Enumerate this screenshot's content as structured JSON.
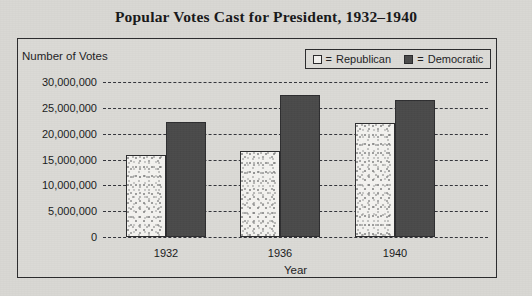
{
  "chart_data": {
    "type": "bar",
    "title": "Popular Votes Cast for President, 1932–1940",
    "xlabel": "Year",
    "ylabel": "Number of Votes",
    "categories": [
      "1932",
      "1936",
      "1940"
    ],
    "series": [
      {
        "name": "Republican",
        "values": [
          15800000,
          16700000,
          22000000
        ],
        "color": "#f4f3f0",
        "pattern": "stipple"
      },
      {
        "name": "Democratic",
        "values": [
          22300000,
          27500000,
          26500000
        ],
        "color": "#4a4a4a",
        "pattern": "solid"
      }
    ],
    "ylim": [
      0,
      30000000
    ],
    "ytick_values": [
      30000000,
      25000000,
      20000000,
      15000000,
      10000000,
      5000000,
      0
    ],
    "ytick_labels": [
      "30,000,000",
      "25,000,000",
      "20,000,000",
      "15,000,000",
      "10,000,000",
      "5,000,000",
      "0"
    ],
    "grid": true,
    "grid_style": "dashed",
    "legend_position": "top-right",
    "legend_entries": [
      {
        "label": "Republican",
        "separator": "="
      },
      {
        "label": "Democratic",
        "separator": "="
      }
    ]
  },
  "colors": {
    "background": "#d9d8d4",
    "panel_border": "#2b2b2d",
    "gridline": "#33343a",
    "republican_bar": "#f4f3f0",
    "democratic_bar": "#4a4a4a",
    "text": "#1a1a1c"
  }
}
